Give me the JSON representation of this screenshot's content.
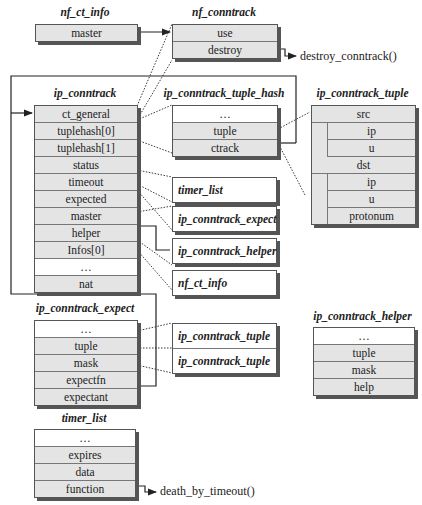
{
  "structs": {
    "nf_ct_info": {
      "title": "nf_ct_info",
      "fields": [
        "master"
      ]
    },
    "nf_conntrack": {
      "title": "nf_conntrack",
      "fields": [
        "use",
        "destroy"
      ]
    },
    "ip_conntrack": {
      "title": "ip_conntrack",
      "fields": [
        "ct_general",
        "tuplehash[0]",
        "tuplehash[1]",
        "status",
        "timeout",
        "expected",
        "master",
        "helper",
        "Infos[0]",
        "…",
        "nat"
      ]
    },
    "ip_conntrack_tuple_hash": {
      "title": "ip_conntrack_tuple_hash",
      "fields": [
        "…",
        "tuple",
        "ctrack"
      ]
    },
    "ip_conntrack_tuple": {
      "title": "ip_conntrack_tuple",
      "fields": [
        "src",
        "ip",
        "u",
        "dst",
        "ip",
        "u",
        "protonum"
      ]
    },
    "ip_conntrack_expect": {
      "title": "ip_conntrack_expect",
      "fields": [
        "…",
        "tuple",
        "mask",
        "expectfn",
        "expectant"
      ]
    },
    "ip_conntrack_helper": {
      "title": "ip_conntrack_helper",
      "fields": [
        "…",
        "tuple",
        "mask",
        "help"
      ]
    },
    "timer_list": {
      "title": "timer_list",
      "fields": [
        "…",
        "expires",
        "data",
        "function"
      ]
    }
  },
  "refs": {
    "timer_list": "timer_list",
    "ip_conntrack_expect": "ip_conntrack_expect",
    "ip_conntrack_helper": "ip_conntrack_helper",
    "nf_ct_info": "nf_ct_info",
    "expect_tuple": "ip_conntrack_tuple",
    "expect_mask": "ip_conntrack_tuple"
  },
  "functions": {
    "destroy": "destroy_conntrack()",
    "timeout": "death_by_timeout()"
  }
}
